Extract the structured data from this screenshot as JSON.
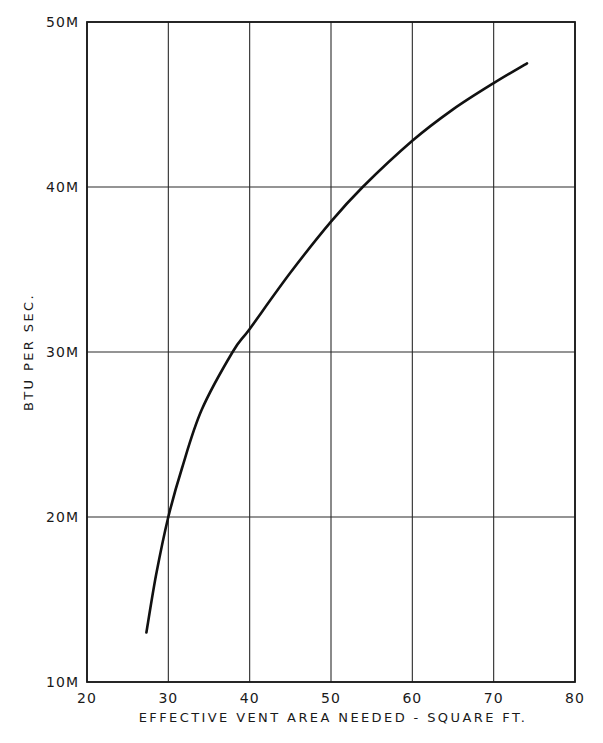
{
  "chart_data": {
    "type": "line",
    "title": "",
    "xlabel": "EFFECTIVE VENT AREA NEEDED - SQUARE FT.",
    "ylabel": "BTU PER SEC.",
    "xlim": [
      20,
      80
    ],
    "ylim": [
      10,
      50
    ],
    "x_ticks": [
      20,
      30,
      40,
      50,
      60,
      70,
      80
    ],
    "x_tick_labels": [
      "20",
      "30",
      "40",
      "50",
      "60",
      "70",
      "80"
    ],
    "y_ticks": [
      10,
      20,
      30,
      40,
      50
    ],
    "y_tick_labels": [
      "10M",
      "20M",
      "30M",
      "40M",
      "50M"
    ],
    "grid": true,
    "legend": null,
    "series": [
      {
        "name": "BTU per sec vs effective vent area",
        "x": [
          27.3,
          28.5,
          30.0,
          31.7,
          34.1,
          37.9,
          40.0,
          45.0,
          50.0,
          53.9,
          60.0,
          65.0,
          70.0,
          74.1
        ],
        "y": [
          13.0,
          16.5,
          20.0,
          23.0,
          26.5,
          30.0,
          31.4,
          34.8,
          37.9,
          40.0,
          42.8,
          44.7,
          46.3,
          47.5
        ]
      }
    ]
  },
  "labels": {
    "xlabel": "EFFECTIVE VENT AREA NEEDED - SQUARE FT.",
    "ylabel": "BTU PER SEC."
  }
}
